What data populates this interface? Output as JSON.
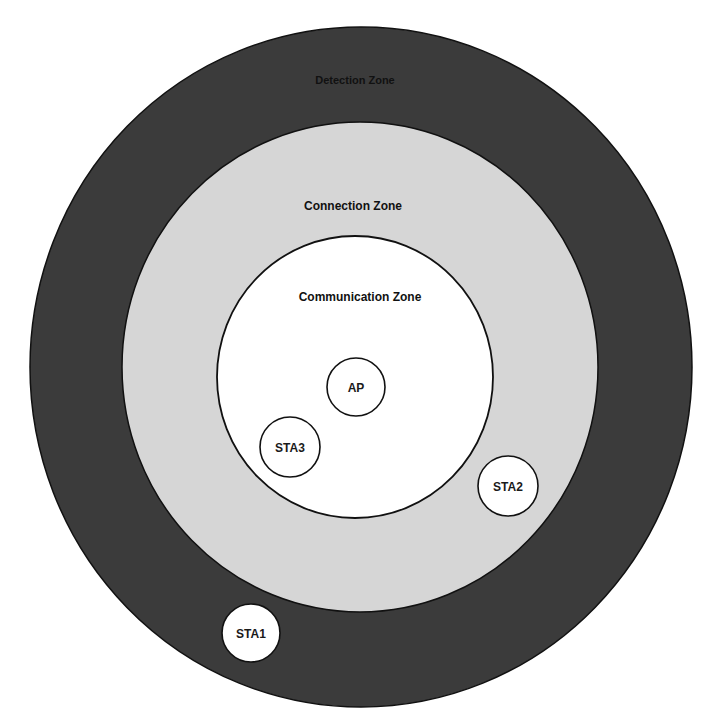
{
  "diagram": {
    "colors": {
      "background": "#ffffff",
      "detection_fill": "#3b3b3b",
      "connection_fill": "#d6d6d6",
      "communication_fill": "#ffffff",
      "node_fill": "#ffffff",
      "stroke": "#111111",
      "text": "#111111"
    },
    "zones": [
      {
        "id": "detection",
        "label": "Detection Zone",
        "cx": 361,
        "cy": 367,
        "rx": 331,
        "ry": 340,
        "label_x": 355,
        "label_y": 84,
        "font_size": 11
      },
      {
        "id": "connection",
        "label": "Connection Zone",
        "cx": 360,
        "cy": 367,
        "rx": 238,
        "ry": 245,
        "label_x": 353,
        "label_y": 210,
        "font_size": 12
      },
      {
        "id": "communication",
        "label": "Communication Zone",
        "cx": 355,
        "cy": 377,
        "rx": 138,
        "ry": 141,
        "label_x": 360,
        "label_y": 301,
        "font_size": 12
      }
    ],
    "nodes": [
      {
        "id": "ap",
        "label": "AP",
        "cx": 356,
        "cy": 387,
        "r": 29
      },
      {
        "id": "sta3",
        "label": "STA3",
        "cx": 290,
        "cy": 447,
        "r": 30
      },
      {
        "id": "sta2",
        "label": "STA2",
        "cx": 508,
        "cy": 486,
        "r": 30
      },
      {
        "id": "sta1",
        "label": "STA1",
        "cx": 251,
        "cy": 633,
        "r": 29
      }
    ]
  }
}
